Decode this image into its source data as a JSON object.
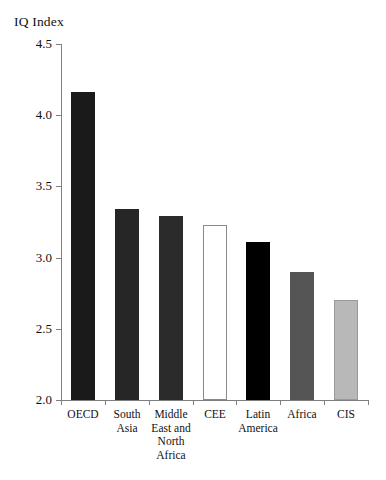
{
  "chart_data": {
    "type": "bar",
    "title": "",
    "ylabel": "IQ Index",
    "xlabel": "",
    "ylim": [
      2.0,
      4.5
    ],
    "yticks": [
      "2.0",
      "2.5",
      "3.0",
      "3.5",
      "4.0",
      "4.5"
    ],
    "ytick_values": [
      2.0,
      2.5,
      3.0,
      3.5,
      4.0,
      4.5
    ],
    "grid": false,
    "legend": "none",
    "categories": [
      "OECD",
      "South\nAsia",
      "Middle\nEast and\nNorth\nAfrica",
      "CEE",
      "Latin\nAmerica",
      "Africa",
      "CIS"
    ],
    "values": [
      4.16,
      3.34,
      3.29,
      3.23,
      3.11,
      2.9,
      2.7
    ],
    "bar_colors": [
      "#1a1a1a",
      "#262626",
      "#2b2b2b",
      "#ffffff",
      "#000000",
      "#555555",
      "#b8b8b8"
    ],
    "bar_edge_colors": [
      "#1a1a1a",
      "#262626",
      "#2b2b2b",
      "#8a8a8a",
      "#000000",
      "#555555",
      "#9a9a9a"
    ]
  },
  "axis": {
    "line_color": "#7f7f7f"
  }
}
